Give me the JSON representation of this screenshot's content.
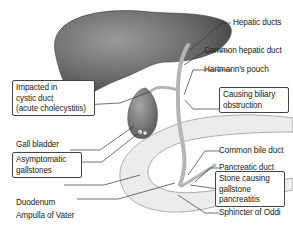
{
  "diagram": {
    "title": "",
    "type": "anatomical-labelled-diagram",
    "colors": {
      "organ_dark": "#4a4a4a",
      "organ_light": "#bcbcbc",
      "duodenum": "#e6e6e6",
      "leader_line": "#333333",
      "box_border": "#444444"
    },
    "labels_right": {
      "hepatic_ducts": "Hepatic ducts",
      "common_hepatic_duct": "Common hepatic duct",
      "hartmanns_pouch": "Hartmann's pouch",
      "common_bile_duct": "Common bile duct",
      "pancreatic_duct": "Pancreatic duct",
      "sphincter_of_oddi": "Sphincter of Oddi"
    },
    "labels_left": {
      "gall_bladder": "Gall bladder",
      "duodenum": "Duodenum",
      "ampulla_of_vater": "Ampulla of Vater"
    },
    "boxes": {
      "impacted": [
        "Impacted in",
        "cystic duct",
        "(acute cholecystitis)"
      ],
      "biliary": [
        "Causing biliary",
        "obstruction"
      ],
      "asymptomatic": [
        "Asymptomatic",
        "gallstones"
      ],
      "pancreatitis": [
        "Stone causing",
        "gallstone",
        "pancreatitis"
      ]
    }
  }
}
